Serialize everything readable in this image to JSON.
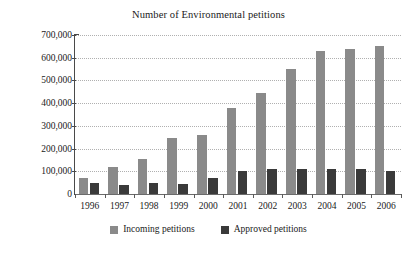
{
  "chart_data": {
    "type": "bar",
    "title": "Number of Environmental petitions",
    "xlabel": "",
    "ylabel": "",
    "categories": [
      "1996",
      "1997",
      "1998",
      "1999",
      "2000",
      "2001",
      "2002",
      "2003",
      "2004",
      "2005",
      "2006"
    ],
    "series": [
      {
        "name": "Incoming petitions",
        "color": "#8a8a8a",
        "values": [
          72000,
          120000,
          155000,
          248000,
          262000,
          378000,
          443000,
          550000,
          630000,
          640000,
          650000
        ]
      },
      {
        "name": "Approved petitions",
        "color": "#3a3a3a",
        "values": [
          48000,
          38000,
          50000,
          45000,
          70000,
          100000,
          110000,
          110000,
          110000,
          112000,
          100000
        ]
      }
    ],
    "ylim": [
      0,
      700000
    ],
    "ytick_values": [
      0,
      100000,
      200000,
      300000,
      400000,
      500000,
      600000,
      700000
    ],
    "ytick_labels": [
      "0",
      "100,000",
      "200,000",
      "300,000",
      "400,000",
      "500,000",
      "600,000",
      "700,000"
    ],
    "grid": true,
    "legend_position": "bottom"
  },
  "legend": {
    "items": [
      {
        "label": "Incoming petitions",
        "color": "#8a8a8a"
      },
      {
        "label": "Approved petitions",
        "color": "#3a3a3a"
      }
    ]
  }
}
